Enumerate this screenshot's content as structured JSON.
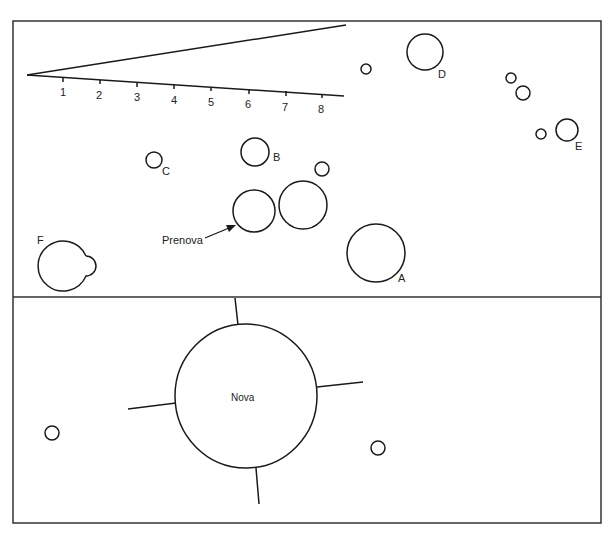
{
  "panels": {
    "top": {
      "scale": {
        "ticks": [
          "1",
          "2",
          "3",
          "4",
          "5",
          "6",
          "7",
          "8"
        ]
      },
      "star_labels": {
        "A": "A",
        "B": "B",
        "C": "C",
        "D": "D",
        "E": "E",
        "F": "F"
      },
      "prenova_label": "Prenova"
    },
    "bottom": {
      "nova_label": "Nova"
    }
  },
  "colors": {
    "stroke": "#1a1a1a",
    "background": "#ffffff"
  }
}
